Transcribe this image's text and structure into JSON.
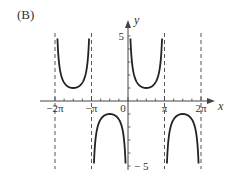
{
  "panel_label": "(B)",
  "chart_data": {
    "type": "line",
    "title": "",
    "function": "y = csc(x)",
    "xlabel": "x",
    "ylabel": "y",
    "xlim": [
      -6.9,
      7.3
    ],
    "ylim": [
      -5,
      5
    ],
    "x_tick_labels": [
      "-2π",
      "-π",
      "0",
      "π",
      "2π"
    ],
    "x_ticks": [
      -6.2832,
      -3.1416,
      0,
      3.1416,
      6.2832
    ],
    "y_tick_labels": [
      "5",
      "-5"
    ],
    "y_ticks": [
      5,
      -5
    ],
    "minor_x_ticks_per_pi": 4,
    "minor_y_ticks_per_unit": 1,
    "asymptotes_x": [
      -6.2832,
      -3.1416,
      3.1416,
      6.2832
    ],
    "asymptote_style": "dashed",
    "grid": false,
    "legend": null,
    "branches": [
      {
        "interval": [
          -6.2832,
          -3.1416
        ],
        "direction": "up",
        "extremum": {
          "x": -4.7124,
          "y": 1
        }
      },
      {
        "interval": [
          -3.1416,
          0
        ],
        "direction": "down",
        "extremum": {
          "x": -1.5708,
          "y": -1
        }
      },
      {
        "interval": [
          0,
          3.1416
        ],
        "direction": "up",
        "extremum": {
          "x": 1.5708,
          "y": 1
        }
      },
      {
        "interval": [
          3.1416,
          6.2832
        ],
        "direction": "down",
        "extremum": {
          "x": 4.7124,
          "y": -1
        }
      }
    ],
    "curve_color": "#222222",
    "axis_color": "#444444",
    "asymptote_color": "#555555"
  }
}
